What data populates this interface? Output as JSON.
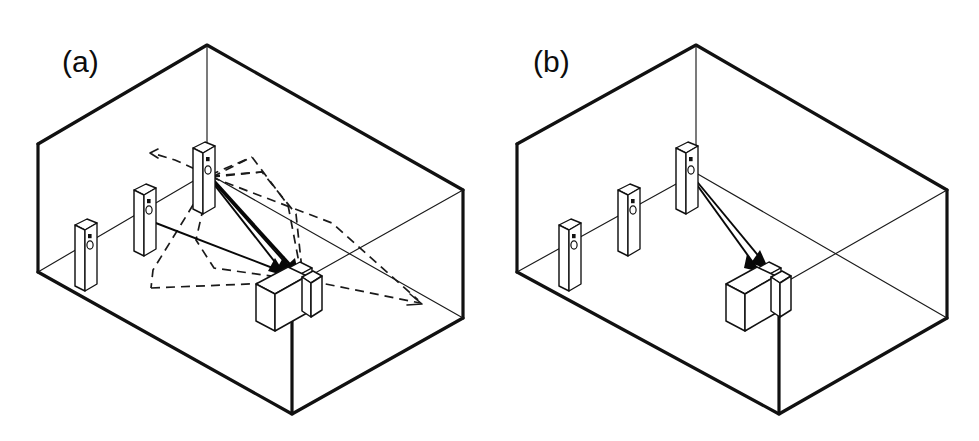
{
  "figure": {
    "background_color": "#ffffff",
    "line_color": "#111111",
    "width": 979,
    "height": 441
  },
  "panels": [
    {
      "id": "a",
      "label": "(a)",
      "label_x": 62,
      "label_y": 72,
      "description": "Room with multipath propagation: solid direct rays and dashed reflected rays from transmitter post to receiver unit",
      "room": {
        "name": "rectangular-room-wireframe",
        "top_apex": [
          207,
          45
        ],
        "left_corner_top": [
          38,
          144
        ],
        "right_corner_top": [
          463,
          190
        ],
        "bottom_apex": [
          292,
          414
        ],
        "left_corner_bottom": [
          38,
          272
        ],
        "right_corner_bottom": [
          463,
          318
        ],
        "far_right_top": [
          463,
          190
        ]
      },
      "posts": [
        {
          "name": "post-1",
          "x": 84,
          "y": 232,
          "height": 62,
          "dots": 2
        },
        {
          "name": "post-2",
          "x": 143,
          "y": 197,
          "height": 62,
          "dots": 2
        },
        {
          "name": "post-3-transmitter",
          "x": 202,
          "y": 155,
          "height": 62,
          "dots": 2
        }
      ],
      "receiver": {
        "name": "receiver-cabinet",
        "x": 255,
        "y": 262,
        "label": "receiver"
      },
      "rays": {
        "solid_count": 5,
        "dashed_count": 8,
        "solid_label": "direct-path",
        "dashed_label": "reflected-path"
      }
    },
    {
      "id": "b",
      "label": "(b)",
      "label_x": 533,
      "label_y": 72,
      "description": "Room with line-of-sight only: two solid direct rays from transmitter post to receiver unit",
      "room": {
        "name": "rectangular-room-wireframe",
        "top_apex": [
          696,
          45
        ],
        "left_corner_top": [
          517,
          144
        ],
        "right_corner_top": [
          947,
          190
        ],
        "bottom_apex": [
          779,
          414
        ],
        "left_corner_bottom": [
          517,
          272
        ],
        "right_corner_bottom": [
          947,
          318
        ]
      },
      "posts": [
        {
          "name": "post-1",
          "x": 567,
          "y": 232,
          "height": 62,
          "dots": 2
        },
        {
          "name": "post-2",
          "x": 628,
          "y": 197,
          "height": 62,
          "dots": 2
        },
        {
          "name": "post-3-transmitter",
          "x": 684,
          "y": 155,
          "height": 62,
          "dots": 2
        }
      ],
      "receiver": {
        "name": "receiver-cabinet",
        "x": 742,
        "y": 262,
        "label": "receiver"
      },
      "rays": {
        "solid_count": 2,
        "dashed_count": 0,
        "solid_label": "line-of-sight-path",
        "dashed_label": ""
      }
    }
  ]
}
